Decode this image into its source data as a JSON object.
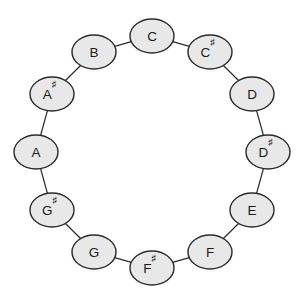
{
  "diagram": {
    "background_color": "#ffffff",
    "node_fill_color": "#e8e8e8",
    "node_stroke_color": "#2b2b2b",
    "edge_color": "#2b2b2b",
    "label_color": "#1a1a1a",
    "layout": {
      "type": "circle",
      "center_x": 152,
      "center_y": 152,
      "radius": 116,
      "node_rx": 22,
      "node_ry": 17,
      "node_count": 12,
      "start_angle_deg": -90,
      "direction": "clockwise"
    },
    "nodes": [
      {
        "id": "C",
        "base": "C",
        "accidental": "",
        "label": "C",
        "index": 0,
        "angle_deg": -90,
        "cx": 152,
        "cy": 36
      },
      {
        "id": "C#",
        "base": "C",
        "accidental": "♯",
        "label": "C♯",
        "index": 1,
        "angle_deg": -60,
        "cx": 210,
        "cy": 52
      },
      {
        "id": "D",
        "base": "D",
        "accidental": "",
        "label": "D",
        "index": 2,
        "angle_deg": -30,
        "cx": 252,
        "cy": 94
      },
      {
        "id": "D#",
        "base": "D",
        "accidental": "♯",
        "label": "D♯",
        "index": 3,
        "angle_deg": 0,
        "cx": 268,
        "cy": 152
      },
      {
        "id": "E",
        "base": "E",
        "accidental": "",
        "label": "E",
        "index": 4,
        "angle_deg": 30,
        "cx": 252,
        "cy": 210
      },
      {
        "id": "F",
        "base": "F",
        "accidental": "",
        "label": "F",
        "index": 5,
        "angle_deg": 60,
        "cx": 210,
        "cy": 252
      },
      {
        "id": "F#",
        "base": "F",
        "accidental": "♯",
        "label": "F♯",
        "index": 6,
        "angle_deg": 90,
        "cx": 152,
        "cy": 268
      },
      {
        "id": "G",
        "base": "G",
        "accidental": "",
        "label": "G",
        "index": 7,
        "angle_deg": 120,
        "cx": 94,
        "cy": 252
      },
      {
        "id": "G#",
        "base": "G",
        "accidental": "♯",
        "label": "G♯",
        "index": 8,
        "angle_deg": 150,
        "cx": 52,
        "cy": 210
      },
      {
        "id": "A",
        "base": "A",
        "accidental": "",
        "label": "A",
        "index": 9,
        "angle_deg": 180,
        "cx": 36,
        "cy": 152
      },
      {
        "id": "A#",
        "base": "A",
        "accidental": "♯",
        "label": "A♯",
        "index": 10,
        "angle_deg": 210,
        "cx": 52,
        "cy": 94
      },
      {
        "id": "B",
        "base": "B",
        "accidental": "",
        "label": "B",
        "index": 11,
        "angle_deg": 240,
        "cx": 94,
        "cy": 52
      }
    ],
    "edges": [
      {
        "from": "C",
        "to": "C#"
      },
      {
        "from": "C#",
        "to": "D"
      },
      {
        "from": "D",
        "to": "D#"
      },
      {
        "from": "D#",
        "to": "E"
      },
      {
        "from": "E",
        "to": "F"
      },
      {
        "from": "F",
        "to": "F#"
      },
      {
        "from": "F#",
        "to": "G"
      },
      {
        "from": "G",
        "to": "G#"
      },
      {
        "from": "G#",
        "to": "A"
      },
      {
        "from": "A",
        "to": "A#"
      },
      {
        "from": "A#",
        "to": "B"
      },
      {
        "from": "B",
        "to": "C"
      }
    ]
  }
}
